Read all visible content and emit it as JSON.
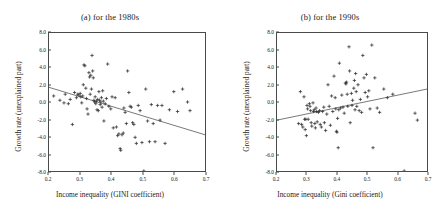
{
  "figure": {
    "marker": "plus",
    "marker_color": "#2b2b2b",
    "line_color": "#555555",
    "frame_color": "#4a4a4a",
    "background": "#ffffff"
  },
  "chart_data": [
    {
      "type": "scatter",
      "panel_id": "a",
      "title": "(a) for the 1980s",
      "xlabel": "Income inequality (GINI coefficient)",
      "ylabel": "Growth rate (unexplained part)",
      "xlim": [
        0.2,
        0.7
      ],
      "ylim": [
        -8.0,
        8.0
      ],
      "xticks": [
        0.2,
        0.3,
        0.4,
        0.5,
        0.6,
        0.7
      ],
      "xticklabels": [
        "0.2",
        "0.3",
        "0.4",
        "0.5",
        "0.6",
        "0.7"
      ],
      "yticks": [
        8.0,
        6.0,
        4.0,
        2.0,
        0.0,
        -2.0,
        -4.0,
        -6.0,
        -8.0
      ],
      "yticklabels": [
        "8.0",
        "6.0",
        "4.0",
        "2.0",
        "0.0",
        "-2.0",
        "-4.0",
        "-6.0",
        "-8.0"
      ],
      "grid": false,
      "legend": null,
      "trendline": {
        "slope": -11.0,
        "intercept": 3.9,
        "x_start": 0.2,
        "y_start": 1.7,
        "x_end": 0.7,
        "y_end": -3.8
      },
      "points": [
        [
          0.215,
          0.7
        ],
        [
          0.235,
          0.2
        ],
        [
          0.248,
          -0.1
        ],
        [
          0.252,
          0.9
        ],
        [
          0.262,
          -0.2
        ],
        [
          0.268,
          0.3
        ],
        [
          0.275,
          -2.6
        ],
        [
          0.282,
          1.1
        ],
        [
          0.288,
          0.5
        ],
        [
          0.292,
          0.9
        ],
        [
          0.296,
          0.8
        ],
        [
          0.3,
          1.0
        ],
        [
          0.302,
          0.6
        ],
        [
          0.305,
          -0.1
        ],
        [
          0.308,
          0.7
        ],
        [
          0.31,
          2.0
        ],
        [
          0.312,
          4.3
        ],
        [
          0.315,
          4.2
        ],
        [
          0.318,
          1.6
        ],
        [
          0.32,
          0.4
        ],
        [
          0.322,
          -0.8
        ],
        [
          0.325,
          -1.4
        ],
        [
          0.328,
          3.4
        ],
        [
          0.33,
          2.9
        ],
        [
          0.332,
          0.9
        ],
        [
          0.334,
          3.1
        ],
        [
          0.336,
          1.5
        ],
        [
          0.338,
          5.4
        ],
        [
          0.34,
          3.6
        ],
        [
          0.342,
          2.8
        ],
        [
          0.344,
          0.2
        ],
        [
          0.346,
          0.0
        ],
        [
          0.348,
          0.6
        ],
        [
          0.35,
          -0.2
        ],
        [
          0.352,
          0.1
        ],
        [
          0.354,
          -0.9
        ],
        [
          0.356,
          0.3
        ],
        [
          0.358,
          -1.0
        ],
        [
          0.36,
          1.2
        ],
        [
          0.362,
          0.2
        ],
        [
          0.364,
          -0.3
        ],
        [
          0.366,
          0.0
        ],
        [
          0.368,
          0.5
        ],
        [
          0.37,
          -0.6
        ],
        [
          0.372,
          1.3
        ],
        [
          0.374,
          0.1
        ],
        [
          0.376,
          -2.2
        ],
        [
          0.38,
          -0.2
        ],
        [
          0.384,
          0.4
        ],
        [
          0.388,
          4.4
        ],
        [
          0.392,
          -0.5
        ],
        [
          0.398,
          -0.8
        ],
        [
          0.402,
          0.6
        ],
        [
          0.406,
          -3.0
        ],
        [
          0.412,
          0.5
        ],
        [
          0.416,
          -2.9
        ],
        [
          0.42,
          -3.9
        ],
        [
          0.424,
          -3.7
        ],
        [
          0.428,
          -5.4
        ],
        [
          0.43,
          -5.6
        ],
        [
          0.434,
          -3.8
        ],
        [
          0.438,
          -3.6
        ],
        [
          0.44,
          -0.7
        ],
        [
          0.444,
          -1.2
        ],
        [
          0.448,
          -2.5
        ],
        [
          0.452,
          3.6
        ],
        [
          0.456,
          1.1
        ],
        [
          0.46,
          -0.5
        ],
        [
          0.464,
          -0.6
        ],
        [
          0.468,
          -2.4
        ],
        [
          0.472,
          -2.6
        ],
        [
          0.476,
          -4.1
        ],
        [
          0.48,
          -4.8
        ],
        [
          0.486,
          -0.4
        ],
        [
          0.492,
          -1.0
        ],
        [
          0.498,
          -4.7
        ],
        [
          0.504,
          -8.0
        ],
        [
          0.51,
          1.5
        ],
        [
          0.516,
          -2.2
        ],
        [
          0.522,
          -4.6
        ],
        [
          0.528,
          -0.3
        ],
        [
          0.534,
          -2.5
        ],
        [
          0.54,
          -4.6
        ],
        [
          0.548,
          -0.4
        ],
        [
          0.556,
          -2.1
        ],
        [
          0.562,
          -0.4
        ],
        [
          0.572,
          -4.8
        ],
        [
          0.586,
          -0.9
        ],
        [
          0.6,
          1.2
        ],
        [
          0.612,
          -1.1
        ],
        [
          0.628,
          1.5
        ],
        [
          0.644,
          0.0
        ],
        [
          0.652,
          -1.0
        ]
      ]
    },
    {
      "type": "scatter",
      "panel_id": "b",
      "title": "(b) for the 1990s",
      "xlabel": "Income inequality (Gini coefficient)",
      "ylabel": "Growth rate (unexplained part)",
      "xlim": [
        0.2,
        0.7
      ],
      "ylim": [
        -8.0,
        8.0
      ],
      "xticks": [
        0.2,
        0.3,
        0.4,
        0.5,
        0.6,
        0.7
      ],
      "xticklabels": [
        "0.2",
        "0.3",
        "0.4",
        "0.5",
        "0.6",
        "0.7"
      ],
      "yticks": [
        8.0,
        6.0,
        4.0,
        2.0,
        0.0,
        -2.0,
        -4.0,
        -6.0,
        -8.0
      ],
      "yticklabels": [
        "8.0",
        "6.0",
        "4.0",
        "2.0",
        "0.0",
        "-2.0",
        "-4.0",
        "-6.0",
        "-8.0"
      ],
      "grid": false,
      "legend": null,
      "trendline": {
        "slope": 7.0,
        "intercept": -3.5,
        "x_start": 0.2,
        "y_start": -2.1,
        "x_end": 0.7,
        "y_end": 1.5
      },
      "points": [
        [
          0.272,
          -2.5
        ],
        [
          0.278,
          1.2
        ],
        [
          0.282,
          -2.6
        ],
        [
          0.286,
          -2.9
        ],
        [
          0.29,
          0.6
        ],
        [
          0.292,
          -2.0
        ],
        [
          0.294,
          -3.2
        ],
        [
          0.296,
          -2.0
        ],
        [
          0.298,
          -3.9
        ],
        [
          0.3,
          -0.4
        ],
        [
          0.302,
          -0.8
        ],
        [
          0.304,
          -2.0
        ],
        [
          0.308,
          -0.2
        ],
        [
          0.31,
          -0.5
        ],
        [
          0.312,
          -1.0
        ],
        [
          0.314,
          -2.4
        ],
        [
          0.316,
          -2.8
        ],
        [
          0.32,
          -0.1
        ],
        [
          0.322,
          -1.1
        ],
        [
          0.324,
          -0.9
        ],
        [
          0.326,
          -2.5
        ],
        [
          0.328,
          -3.0
        ],
        [
          0.33,
          -0.7
        ],
        [
          0.332,
          -1.1
        ],
        [
          0.334,
          -2.3
        ],
        [
          0.338,
          -1.2
        ],
        [
          0.342,
          -1.0
        ],
        [
          0.344,
          -2.6
        ],
        [
          0.348,
          -2.9
        ],
        [
          0.352,
          -1.1
        ],
        [
          0.356,
          -0.6
        ],
        [
          0.358,
          -2.4
        ],
        [
          0.362,
          -3.3
        ],
        [
          0.366,
          -1.4
        ],
        [
          0.37,
          2.0
        ],
        [
          0.374,
          -0.5
        ],
        [
          0.378,
          -2.7
        ],
        [
          0.382,
          0.7
        ],
        [
          0.386,
          -1.1
        ],
        [
          0.39,
          3.0
        ],
        [
          0.394,
          0.5
        ],
        [
          0.396,
          -0.8
        ],
        [
          0.398,
          -3.4
        ],
        [
          0.4,
          -3.5
        ],
        [
          0.402,
          -1.9
        ],
        [
          0.404,
          -5.3
        ],
        [
          0.406,
          -0.9
        ],
        [
          0.408,
          4.5
        ],
        [
          0.412,
          -0.7
        ],
        [
          0.416,
          0.8
        ],
        [
          0.42,
          -0.6
        ],
        [
          0.424,
          -1.3
        ],
        [
          0.428,
          2.2
        ],
        [
          0.43,
          2.1
        ],
        [
          0.432,
          2.3
        ],
        [
          0.434,
          0.9
        ],
        [
          0.436,
          -0.5
        ],
        [
          0.44,
          6.4
        ],
        [
          0.442,
          3.6
        ],
        [
          0.444,
          -2.4
        ],
        [
          0.448,
          1.0
        ],
        [
          0.45,
          -0.4
        ],
        [
          0.452,
          0.2
        ],
        [
          0.456,
          1.6
        ],
        [
          0.458,
          2.5
        ],
        [
          0.46,
          -0.9
        ],
        [
          0.462,
          3.3
        ],
        [
          0.464,
          1.2
        ],
        [
          0.466,
          -0.5
        ],
        [
          0.47,
          2.0
        ],
        [
          0.474,
          -1.0
        ],
        [
          0.478,
          0.3
        ],
        [
          0.482,
          -1.2
        ],
        [
          0.486,
          5.4
        ],
        [
          0.49,
          2.8
        ],
        [
          0.494,
          1.1
        ],
        [
          0.498,
          3.2
        ],
        [
          0.502,
          0.6
        ],
        [
          0.506,
          1.3
        ],
        [
          0.51,
          -0.8
        ],
        [
          0.516,
          6.6
        ],
        [
          0.52,
          -5.3
        ],
        [
          0.526,
          2.8
        ],
        [
          0.534,
          -0.7
        ],
        [
          0.542,
          -1.2
        ],
        [
          0.556,
          1.5
        ],
        [
          0.568,
          0.5
        ],
        [
          0.586,
          0.9
        ],
        [
          0.624,
          -8.0
        ],
        [
          0.66,
          -1.3
        ],
        [
          0.668,
          -2.1
        ]
      ]
    }
  ]
}
